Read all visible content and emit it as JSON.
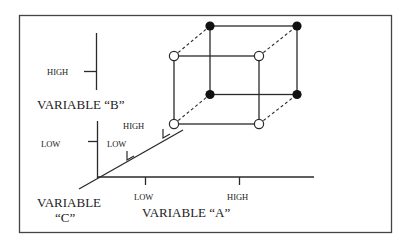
{
  "diagram": {
    "type": "3-factor 2-level factorial design cube",
    "colors": {
      "line": "#2a2a2a",
      "frame": "#444444",
      "filled_point": "#111111",
      "open_point_fill": "#ffffff",
      "text": "#222222"
    },
    "axes": {
      "a": {
        "name": "VARIABLE “A”",
        "low": "LOW",
        "high": "HIGH"
      },
      "b": {
        "name": "VARIABLE “B”",
        "low": "LOW",
        "high": "HIGH"
      },
      "c": {
        "name_line1": "VARIABLE",
        "name_line2": "“C”",
        "low": "LOW",
        "high": "HIGH"
      }
    },
    "cube": {
      "front_face": {
        "label": "front face (open circles)",
        "point_style": "open"
      },
      "back_face": {
        "label": "back face (filled circles)",
        "point_style": "filled"
      },
      "edges_connecting": "dashed"
    }
  }
}
